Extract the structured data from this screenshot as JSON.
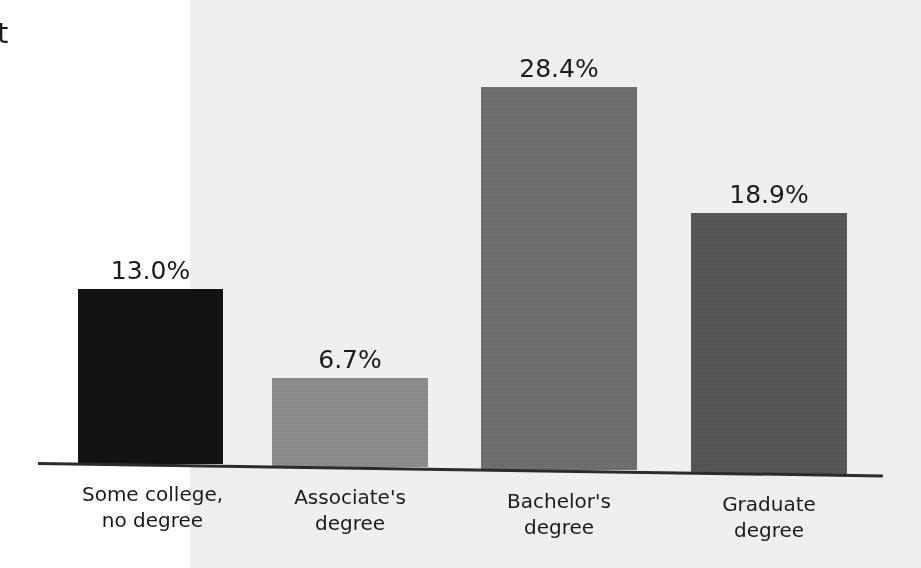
{
  "page": {
    "background_color": "#ffffff",
    "scan_background_color": "#f0f0ef",
    "cropped_text_fragment": "t"
  },
  "axis": {
    "line_color": "#2b2b2b",
    "baseline_y": 462
  },
  "chart_data": {
    "type": "bar",
    "title": "",
    "xlabel": "",
    "ylabel": "",
    "grid": false,
    "legend": "none",
    "ylim": [
      0,
      33
    ],
    "categories": [
      "Some college,\nno degree",
      "Associate's\ndegree",
      "Bachelor's\ndegree",
      "Graduate\ndegree"
    ],
    "values": [
      13.0,
      6.7,
      28.4,
      18.9
    ],
    "value_labels": [
      "13.0%",
      "6.7%",
      "28.4%",
      "18.9%"
    ],
    "bar_colors": [
      "#121212",
      "#8a8a8a",
      "#6e6e6e",
      "#555555"
    ],
    "bars": [
      {
        "category": "Some college,\nno degree",
        "value": 13.0,
        "label": "13.0%",
        "color": "#121212",
        "x": 78,
        "width": 145,
        "top": 289,
        "height": 175,
        "label_x": 78,
        "label_y": 258,
        "cat_label_x": 48,
        "cat_label_y": 482
      },
      {
        "category": "Associate's\ndegree",
        "value": 6.7,
        "label": "6.7%",
        "color": "#8a8a8a",
        "x": 272,
        "width": 156,
        "top": 378,
        "height": 89,
        "label_x": 272,
        "label_y": 347,
        "cat_label_x": 240,
        "cat_label_y": 485
      },
      {
        "category": "Bachelor's\ndegree",
        "value": 28.4,
        "label": "28.4%",
        "color": "#6e6e6e",
        "x": 481,
        "width": 156,
        "top": 87,
        "height": 383,
        "label_x": 481,
        "label_y": 56,
        "cat_label_x": 449,
        "cat_label_y": 489
      },
      {
        "category": "Graduate\ndegree",
        "value": 18.9,
        "label": "18.9%",
        "color": "#555555",
        "x": 691,
        "width": 156,
        "top": 213,
        "height": 261,
        "label_x": 691,
        "label_y": 182,
        "cat_label_x": 659,
        "cat_label_y": 492
      }
    ]
  }
}
